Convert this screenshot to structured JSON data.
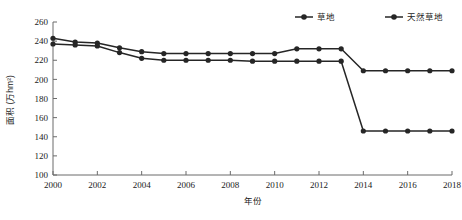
{
  "chart_data": {
    "type": "line",
    "title": "",
    "xlabel": "年份",
    "ylabel": "面积 (万hm²)",
    "xlim": [
      2000,
      2018
    ],
    "ylim": [
      100,
      260
    ],
    "ytick_step": 20,
    "xtick_step": 2,
    "grid": false,
    "legend_position": "top-right",
    "yticks": [
      100,
      120,
      140,
      160,
      180,
      200,
      220,
      240,
      260
    ],
    "xticks": [
      2000,
      2002,
      2004,
      2006,
      2008,
      2010,
      2012,
      2014,
      2016,
      2018
    ],
    "x": [
      2000,
      2001,
      2002,
      2003,
      2004,
      2005,
      2006,
      2007,
      2008,
      2009,
      2010,
      2011,
      2012,
      2013,
      2014,
      2015,
      2016,
      2017,
      2018
    ],
    "series": [
      {
        "name": "草地",
        "marker": "circle",
        "color": "#262626",
        "values": [
          243,
          239,
          238,
          233,
          229,
          227,
          227,
          227,
          227,
          227,
          227,
          232,
          232,
          232,
          209,
          209,
          209,
          209,
          209
        ]
      },
      {
        "name": "天然草地",
        "marker": "circle",
        "color": "#262626",
        "values": [
          237,
          236,
          235,
          228,
          222,
          220,
          220,
          220,
          220,
          219,
          219,
          219,
          219,
          219,
          146,
          146,
          146,
          146,
          146
        ]
      }
    ]
  },
  "axis": {
    "ylabel": "面积 (万hm²)",
    "xlabel": "年份"
  },
  "legend": {
    "items": [
      {
        "label": "草地"
      },
      {
        "label": "天然草地"
      }
    ]
  }
}
